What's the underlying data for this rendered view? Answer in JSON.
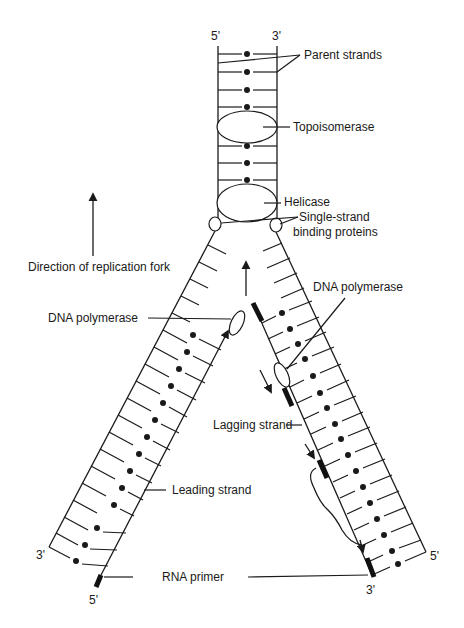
{
  "diagram": {
    "strand_ends": {
      "parent_left_top": "5'",
      "parent_right_top": "3'",
      "left_outer_bottom": "3'",
      "left_inner_bottom": "5'",
      "right_inner_bottom": "3'",
      "right_outer_bottom": "5'"
    },
    "labels": {
      "parent_strands": "Parent strands",
      "topoisomerase": "Topoisomerase",
      "helicase": "Helicase",
      "ssb_line1": "Single-strand",
      "ssb_line2": "binding proteins",
      "direction": "Direction of replication fork",
      "dna_polymerase_left": "DNA polymerase",
      "dna_polymerase_right": "DNA polymerase",
      "lagging_strand": "Lagging strand",
      "leading_strand": "Leading strand",
      "rna_primer": "RNA primer"
    },
    "components": [
      {
        "name": "Parent strands",
        "type": "double helix (ladder)"
      },
      {
        "name": "Topoisomerase",
        "type": "enzyme (ellipse)"
      },
      {
        "name": "Helicase",
        "type": "enzyme (ellipse)"
      },
      {
        "name": "Single-strand binding proteins",
        "type": "protein (small circles)"
      },
      {
        "name": "DNA polymerase",
        "type": "enzyme (leading strand)"
      },
      {
        "name": "DNA polymerase",
        "type": "enzyme (lagging strand)"
      },
      {
        "name": "Leading strand",
        "type": "new strand (continuous)"
      },
      {
        "name": "Lagging strand",
        "type": "new strand (Okazaki fragments)"
      },
      {
        "name": "RNA primer",
        "type": "primer segments"
      }
    ],
    "colors": {
      "ink": "#1a1a1a",
      "background": "#ffffff"
    }
  }
}
